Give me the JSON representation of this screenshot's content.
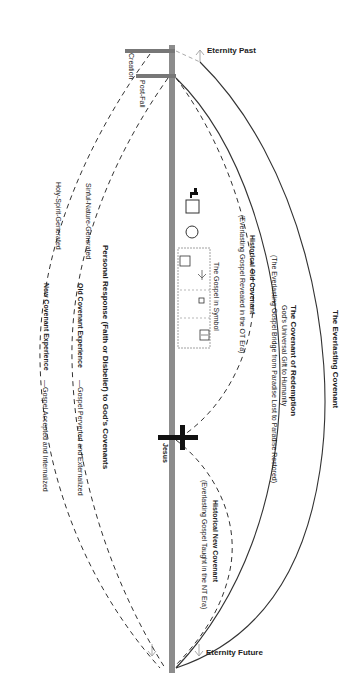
{
  "diagram": {
    "timeline": {
      "top_label": "Eternity Past",
      "bottom_label": "Eternity Future",
      "creation_label": "Creation",
      "post_fall_label": "Post-Fall",
      "jesus_label": "Jesus"
    },
    "covenants": {
      "everlasting": "The Everlasting Covenant",
      "redemption_title": "The Covenant of Redemption",
      "redemption_sub1": "God's Universal Gift to Humanity",
      "redemption_sub2": "(The Everlasting Gospel Bridge from Paradise Lost to Paradise Restored)",
      "old_title": "Historical Old Covenant",
      "old_sub": "(Everlasting Gospel Revealed in the OT Era)",
      "new_title": "Historical New Covenant",
      "new_sub": "(Everlasting Gospel Taught in the NT Era)"
    },
    "symbol_box": {
      "title": "The Gospel in Symbol"
    },
    "personal": {
      "heading": "Personal Response (Faith or Disbelief) to God's Covenants",
      "old_exp_gen": "Sinful-Nature-Generated",
      "old_exp_title": "Old Covenant Experience",
      "old_exp_desc": "—Gospel Perverted and Externalized",
      "new_exp_gen": "Holy-Spirit-Generated",
      "new_exp_title": "New Covenant Experience",
      "new_exp_desc": "—Gospel Accepted and Internalized"
    },
    "colors": {
      "timeline_bar": "#8c8c8c",
      "line": "#333333",
      "text": "#222222"
    }
  }
}
